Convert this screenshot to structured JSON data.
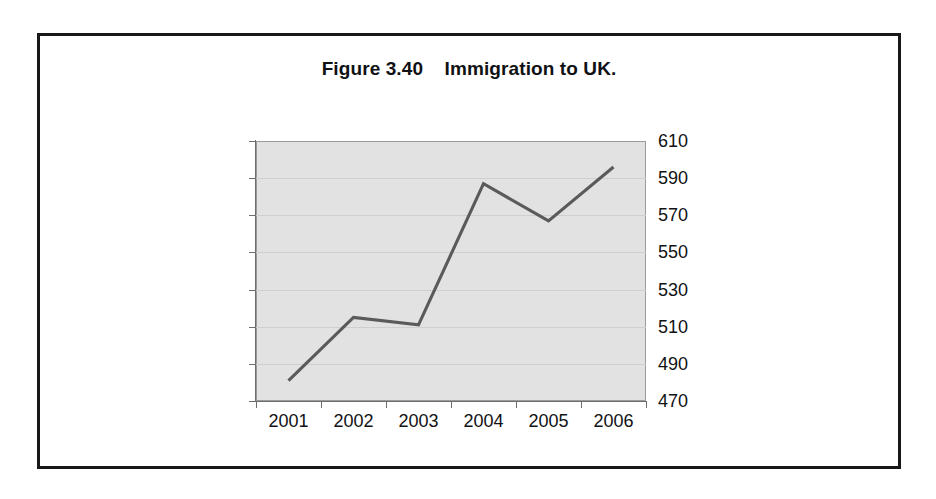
{
  "figure": {
    "title": "Figure 3.40    Immigration to UK.",
    "frame_color": "#17181a",
    "background_color": "#ffffff"
  },
  "chart_data": {
    "type": "line",
    "title": "Figure 3.40    Immigration to UK.",
    "xlabel": "",
    "ylabel": "",
    "categories": [
      "2001",
      "2002",
      "2003",
      "2004",
      "2005",
      "2006"
    ],
    "values": [
      481,
      515,
      511,
      587,
      567,
      596
    ],
    "series": [
      {
        "name": "Immigration to UK",
        "values": [
          481,
          515,
          511,
          587,
          567,
          596
        ]
      }
    ],
    "ylim": [
      470,
      610
    ],
    "ytick_step": 20,
    "yticks": [
      470,
      490,
      510,
      530,
      550,
      570,
      590,
      610
    ],
    "ytick_labels": [
      "470",
      "490",
      "510",
      "530",
      "550",
      "570",
      "590",
      "610"
    ],
    "xticks": [
      "2001",
      "2002",
      "2003",
      "2004",
      "2005",
      "2006"
    ],
    "y_axis_position": "right",
    "grid": true,
    "grid_color": "#cfcfcf",
    "legend": false,
    "legend_position": "none",
    "plot_background": "#e2e2e2",
    "line_color": "#5a5a5a",
    "axis_color": "#6d6d6d",
    "markers": false
  }
}
